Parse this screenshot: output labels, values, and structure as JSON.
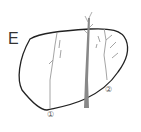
{
  "figure": {
    "panel_label": "E",
    "markers": [
      {
        "id": "1",
        "text": "①"
      },
      {
        "id": "2",
        "text": "②"
      }
    ],
    "colors": {
      "outline": "#222222",
      "tree": "#888888",
      "crack_lines": "#9a9a9a"
    }
  }
}
